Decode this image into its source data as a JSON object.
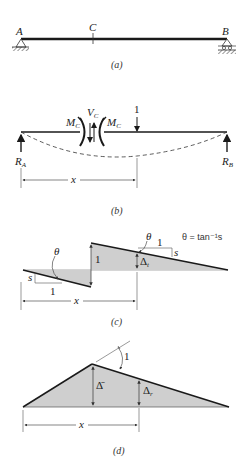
{
  "figure": {
    "panels": [
      {
        "id": "a",
        "caption": "(a)",
        "labels": {
          "left_support": "A",
          "section": "C",
          "right_support": "B"
        }
      },
      {
        "id": "b",
        "caption": "(b)",
        "labels": {
          "moment_left": "M",
          "moment_left_sub": "C",
          "moment_right": "M",
          "moment_right_sub": "C",
          "shear": "V",
          "shear_sub": "C",
          "unit_load": "1",
          "reaction_left": "R",
          "reaction_left_sub": "A",
          "reaction_right": "R",
          "reaction_right_sub": "B",
          "distance": "x"
        }
      },
      {
        "id": "c",
        "caption": "(c)",
        "labels": {
          "theta_left": "θ",
          "slope_left": "s",
          "run_left": "1",
          "jump": "1",
          "theta_right": "θ",
          "run_right": "1",
          "slope_right": "s",
          "deflection": "Δ",
          "deflection_sub": "t",
          "formula": "θ = tan⁻¹s",
          "distance": "x"
        }
      },
      {
        "id": "d",
        "caption": "(d)",
        "labels": {
          "rotation": "1",
          "delta_bar": "Δ̄",
          "deflection": "Δ",
          "deflection_sub": "r",
          "distance": "x"
        }
      }
    ]
  },
  "colors": {
    "line": "#1a1a1a",
    "fill": "#cfcfcf",
    "text": "#222222"
  }
}
